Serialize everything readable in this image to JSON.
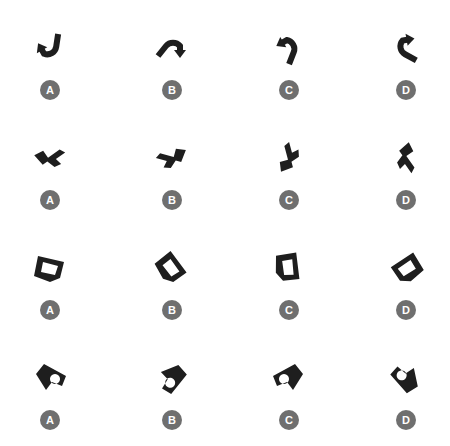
{
  "puzzle": {
    "colors": {
      "shape": "#1e1e1e",
      "badge": "#6f6f6f",
      "badge_text": "#ffffff"
    },
    "rows": [
      {
        "shape_type": "curved-arrow",
        "options": [
          {
            "label": "A",
            "icon": "curved-arrow-icon"
          },
          {
            "label": "B",
            "icon": "curved-arrow-icon"
          },
          {
            "label": "C",
            "icon": "curved-arrow-icon"
          },
          {
            "label": "D",
            "icon": "curved-arrow-icon"
          }
        ]
      },
      {
        "shape_type": "zigzag-polygon",
        "options": [
          {
            "label": "A",
            "icon": "zigzag-shape-icon"
          },
          {
            "label": "B",
            "icon": "zigzag-shape-icon"
          },
          {
            "label": "C",
            "icon": "zigzag-shape-icon"
          },
          {
            "label": "D",
            "icon": "zigzag-shape-icon"
          }
        ]
      },
      {
        "shape_type": "hollow-pentagon",
        "options": [
          {
            "label": "A",
            "icon": "hollow-pentagon-icon"
          },
          {
            "label": "B",
            "icon": "hollow-pentagon-icon"
          },
          {
            "label": "C",
            "icon": "hollow-pentagon-icon"
          },
          {
            "label": "D",
            "icon": "hollow-pentagon-icon"
          }
        ]
      },
      {
        "shape_type": "l-shape-with-hole",
        "options": [
          {
            "label": "A",
            "icon": "l-shape-hole-icon"
          },
          {
            "label": "B",
            "icon": "l-shape-hole-icon"
          },
          {
            "label": "C",
            "icon": "l-shape-hole-icon"
          },
          {
            "label": "D",
            "icon": "l-shape-hole-icon"
          }
        ]
      }
    ]
  }
}
